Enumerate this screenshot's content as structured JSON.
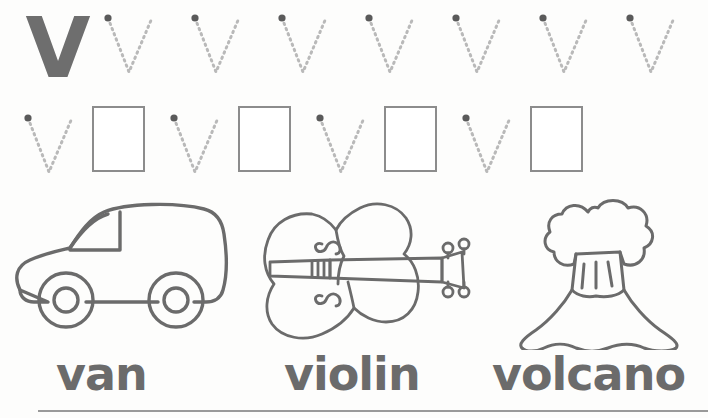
{
  "worksheet": {
    "letter_uppercase": "V",
    "letter_lowercase": "v",
    "model_letter": "V",
    "rows": [
      {
        "name": "row-1",
        "model": "V",
        "trace_count": 7,
        "box_count": 0
      },
      {
        "name": "row-2",
        "model": "",
        "trace_count": 4,
        "box_count": 4
      }
    ],
    "pictures": [
      {
        "name": "van",
        "icon": "van-icon",
        "word": "van"
      },
      {
        "name": "violin",
        "icon": "violin-icon",
        "word": "violin"
      },
      {
        "name": "volcano",
        "icon": "volcano-icon",
        "word": "volcano"
      }
    ],
    "words": {
      "van": "van",
      "violin": "violin",
      "volcano": "volcano"
    },
    "colors": {
      "ink": "#6b6b6b",
      "dotted_guide": "#b9b9b9",
      "start_dot": "#5a5a5a",
      "box_border": "#8c8c8c",
      "paper": "#fdfdfc",
      "rule": "#9a9a9a"
    }
  }
}
